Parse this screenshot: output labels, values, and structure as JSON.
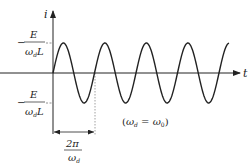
{
  "diagram": {
    "axes": {
      "y_label": "i",
      "x_label": "t"
    },
    "amplitude_label": {
      "numerator": "E",
      "denominator_omega": "ω",
      "denominator_sub": "d",
      "denominator_tail": "L",
      "positive_sign": "",
      "negative_sign": "−"
    },
    "period_label": {
      "numerator": "2π",
      "denominator_omega": "ω",
      "denominator_sub": "d"
    },
    "condition_label": {
      "open": "(",
      "omega_left": "ω",
      "sub_left": "d",
      "equals": " = ",
      "omega_right": "ω",
      "sub_right": "0",
      "close": ")"
    },
    "waveform": {
      "type": "sine",
      "cycles_shown": 4.25,
      "starts_at_zero": true
    },
    "colors": {
      "stroke": "#222222",
      "dashed": "#888888"
    }
  }
}
